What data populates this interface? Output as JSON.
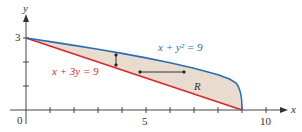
{
  "figure": {
    "axes": {
      "x_label": "x",
      "y_label": "y",
      "x_ticks": [
        "0",
        "5",
        "10"
      ],
      "y_ticks": [
        "3"
      ],
      "x_range": [
        0,
        10
      ],
      "y_range": [
        0,
        3
      ]
    },
    "curves": [
      {
        "name": "parabola",
        "equation": "x + y² = 9",
        "color": "#2a6db5"
      },
      {
        "name": "line",
        "equation": "x + 3y = 9",
        "color": "#d9262c"
      }
    ],
    "region": {
      "label": "R",
      "fill": "#e8dccf"
    },
    "labels": {
      "parabola_eq": "x + y² = 9",
      "line_eq": "x + 3y = 9",
      "region": "R",
      "origin": "0",
      "x5": "5",
      "x10": "10",
      "y3": "3",
      "xaxis": "x",
      "yaxis": "y"
    }
  }
}
